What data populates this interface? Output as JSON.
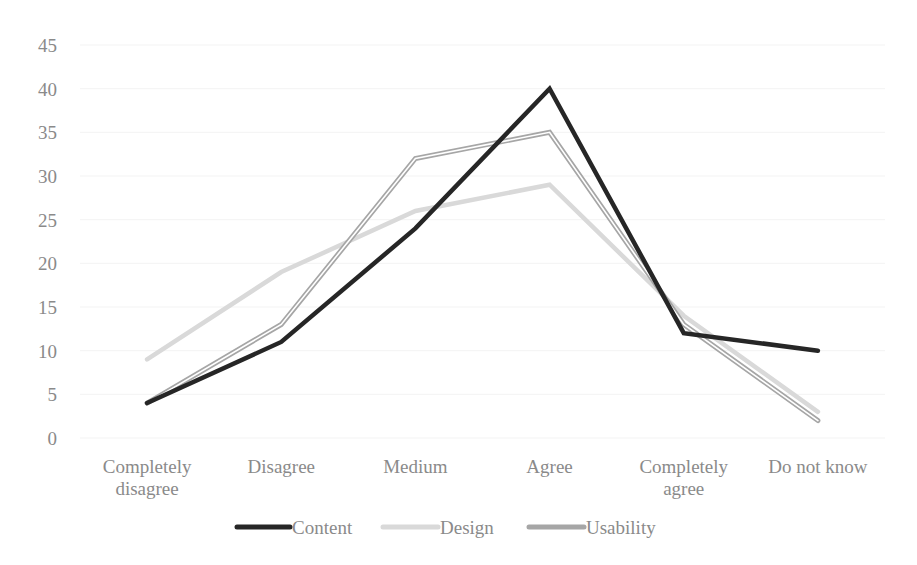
{
  "chart_data": {
    "type": "line",
    "title": "",
    "xlabel": "",
    "ylabel": "",
    "categories": [
      "Completely disagree",
      "Disagree",
      "Medium",
      "Agree",
      "Completely agree",
      "Do not know"
    ],
    "category_lines": [
      [
        "Completely",
        "disagree"
      ],
      [
        "Disagree"
      ],
      [
        "Medium"
      ],
      [
        "Agree"
      ],
      [
        "Completely",
        "agree"
      ],
      [
        "Do not know"
      ]
    ],
    "series": [
      {
        "name": "Content",
        "values": [
          4,
          11,
          24,
          40,
          12,
          10
        ],
        "color": "#262626",
        "style": "solid-thick"
      },
      {
        "name": "Design",
        "values": [
          9,
          19,
          26,
          29,
          14,
          3
        ],
        "color": "#d9d9d9",
        "style": "solid-thick"
      },
      {
        "name": "Usability",
        "values": [
          4,
          13,
          32,
          35,
          13,
          2
        ],
        "color": "#a6a6a6",
        "style": "double"
      }
    ],
    "ylim": [
      0,
      45
    ],
    "yticks": [
      0,
      5,
      10,
      15,
      20,
      25,
      30,
      35,
      40,
      45
    ],
    "grid": true,
    "legend_position": "bottom"
  }
}
